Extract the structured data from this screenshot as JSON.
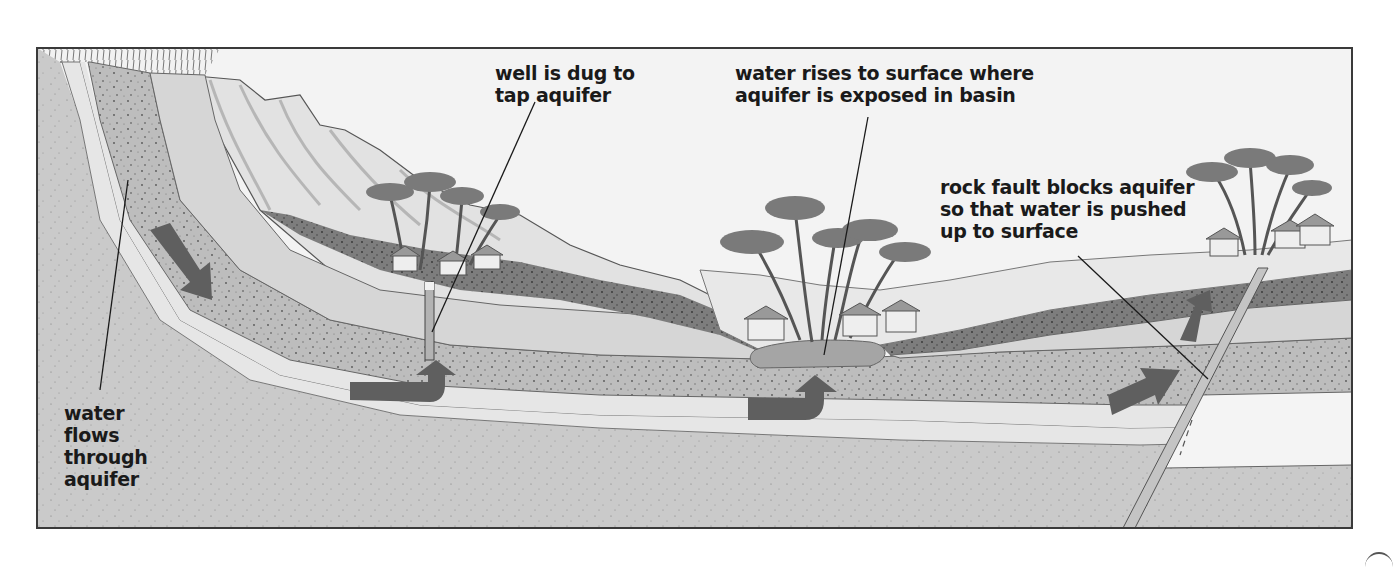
{
  "labels": {
    "well": "well is dug to\ntap aquifer",
    "basin": "water rises to surface where\naquifer is exposed in basin",
    "fault": "rock fault blocks aquifer\nso that water is pushed\nup to surface",
    "flow": "water\nflows\nthrough\naquifer"
  },
  "colors": {
    "frame": "#3a3a3a",
    "sky": "#f4f4f4",
    "aquifer_band": "#b9b9b9",
    "light_band": "#e4e4e4",
    "mid_band": "#cdcdcd",
    "dark_band": "#7a7a7a",
    "arrow": "#5e5e5e",
    "water": "#9e9e9e"
  },
  "features": [
    {
      "name": "well",
      "type": "vertical shaft"
    },
    {
      "name": "basin pond",
      "type": "surface water"
    },
    {
      "name": "rock fault",
      "type": "fault line"
    },
    {
      "name": "flow arrows",
      "count": 5
    }
  ]
}
